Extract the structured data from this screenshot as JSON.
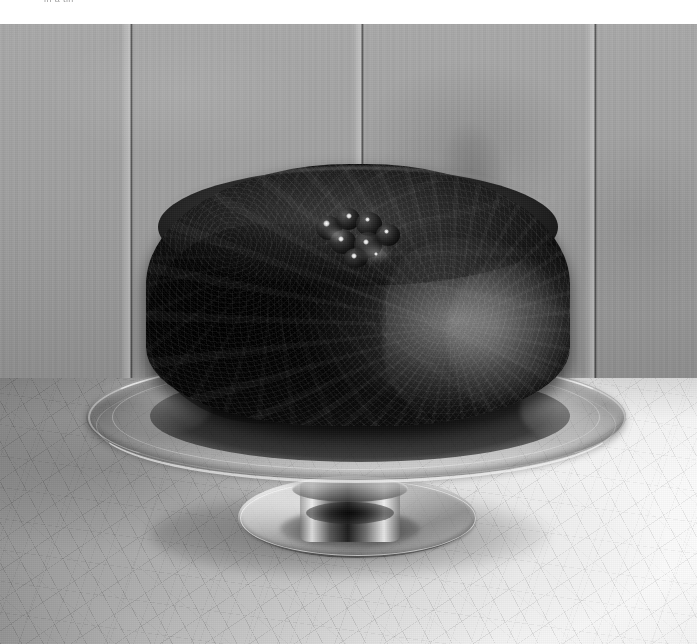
{
  "page": {
    "width": 697,
    "height": 644,
    "rendering": "black-and-white photograph"
  },
  "caption": {
    "text": "in a tin",
    "note": "faint grey text clipped by the top edge of the page"
  },
  "photo": {
    "subject": "dark rich fruit cake (Christmas cake) topped with glace cherries",
    "alt": "A round, deeply browned fruit cake sits on a clear glass pedestal cake stand on a crazed ceramic table in front of a grey wooden plank wall.",
    "elements": [
      {
        "name": "wooden-plank-wall",
        "description": "grey painted vertical boards with three dark seams"
      },
      {
        "name": "fruit-cake",
        "description": "round dark cake with crumbly crust and glossy cherries on top"
      },
      {
        "name": "glass-cake-stand",
        "description": "clear pressed-glass pedestal stand with a bright reflective rim"
      },
      {
        "name": "crackle-glazed-table",
        "description": "pale surface covered in a fine network of crazing lines"
      }
    ],
    "tones": {
      "wall": "#9d9e9b",
      "cake": "#121110",
      "glass_highlight": "#f0f1ef",
      "table_light": "#f1f1f0",
      "table_shadow": "#8e8f8c"
    },
    "wall_seams_x": [
      130,
      361,
      594
    ],
    "cherry_count": 7
  }
}
